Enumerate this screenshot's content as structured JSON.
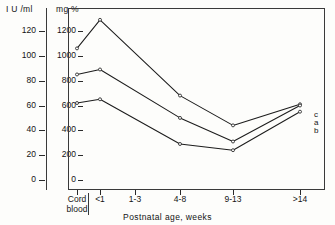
{
  "chart_data": {
    "type": "line",
    "title": "",
    "xlabel": "Postnatal age, weeks",
    "categories": [
      "Cord blood",
      "<1",
      "1-3",
      "4-8",
      "9-13",
      ">14"
    ],
    "grid": false,
    "legend_position": "right-inline",
    "axes": {
      "left": {
        "label": "I U /ml",
        "ticks": [
          0,
          20,
          40,
          60,
          80,
          100,
          120
        ],
        "lim": [
          0,
          130
        ]
      },
      "right_inner": {
        "label": "mg %",
        "ticks": [
          0,
          200,
          400,
          600,
          800,
          1000,
          1200
        ],
        "lim": [
          0,
          1300
        ]
      }
    },
    "series": [
      {
        "name": "c",
        "label": "c",
        "x": [
          "Cord blood",
          "<1",
          "4-8",
          "9-13",
          ">14"
        ],
        "values": [
          1060,
          1290,
          680,
          440,
          610
        ]
      },
      {
        "name": "a",
        "label": "a",
        "x": [
          "Cord blood",
          "<1",
          "4-8",
          "9-13",
          ">14"
        ],
        "values": [
          850,
          890,
          500,
          310,
          600
        ]
      },
      {
        "name": "b",
        "label": "b",
        "x": [
          "Cord blood",
          "<1",
          "4-8",
          "9-13",
          ">14"
        ],
        "values": [
          620,
          650,
          290,
          240,
          550
        ]
      }
    ]
  },
  "xaxis_tick_labels": [
    {
      "line1": "Cord",
      "line2": "blood"
    },
    {
      "line1": "<1",
      "line2": ""
    },
    {
      "line1": "1-3",
      "line2": ""
    },
    {
      "line1": "4-8",
      "line2": ""
    },
    {
      "line1": "9-13",
      "line2": ""
    },
    {
      "line1": ">14",
      "line2": ""
    }
  ],
  "colors": {
    "line": "#1c1c1c",
    "frame": "#3a3a3a",
    "text": "#141414",
    "background": "#fdfdfb"
  }
}
